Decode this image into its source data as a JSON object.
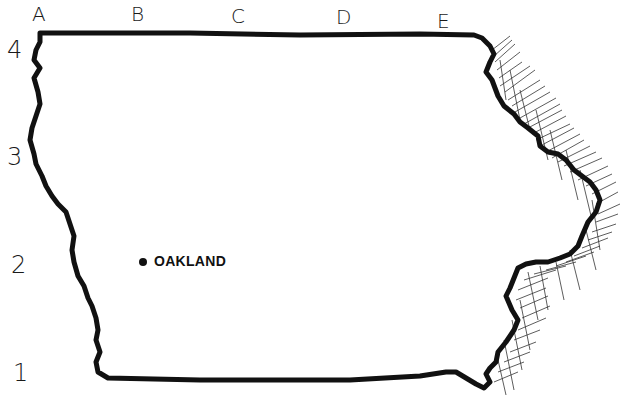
{
  "map": {
    "title": "Iowa outline map",
    "columns": [
      {
        "label": "A",
        "x": 38
      },
      {
        "label": "B",
        "x": 138
      },
      {
        "label": "C",
        "x": 238
      },
      {
        "label": "D",
        "x": 343
      },
      {
        "label": "E",
        "x": 444
      }
    ],
    "rows": [
      {
        "label": "4",
        "y": 52
      },
      {
        "label": "3",
        "y": 158
      },
      {
        "label": "2",
        "y": 265
      },
      {
        "label": "1",
        "y": 373
      }
    ],
    "cities": [
      {
        "name": "OAKLAND",
        "x": 143,
        "y": 262
      }
    ],
    "colors": {
      "outline": "#111111",
      "hatching": "#333333",
      "background": "#ffffff"
    }
  }
}
